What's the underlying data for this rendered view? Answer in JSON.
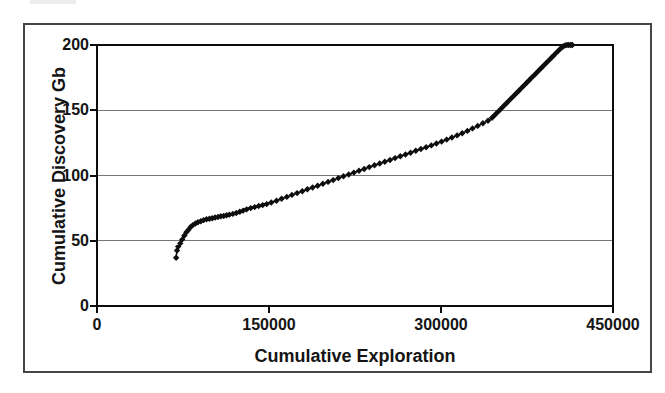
{
  "chart_data": {
    "type": "line",
    "marker": "diamond",
    "title": "",
    "xlabel": "Cumulative Exploration",
    "ylabel": "Cumulative Discovery Gb",
    "xlim": [
      0,
      450000
    ],
    "ylim": [
      0,
      200
    ],
    "x_ticks": [
      0,
      150000,
      300000,
      450000
    ],
    "y_ticks": [
      0,
      50,
      100,
      150,
      200
    ],
    "x_tick_labels": [
      "0",
      "150000",
      "300000",
      "450000"
    ],
    "y_tick_labels": [
      "200",
      "150",
      "100",
      "50",
      "0"
    ],
    "y_gridlines": [
      50,
      100,
      150
    ],
    "grid": "horizontal-only",
    "legend": "none",
    "colors": {
      "series": "#0d0d0d",
      "axis": "#0d0d0d",
      "grid": "#757575",
      "frame": "#454545"
    },
    "points": [
      [
        69000,
        37
      ],
      [
        69800,
        42.5
      ],
      [
        70800,
        45.5
      ],
      [
        72600,
        48
      ],
      [
        74400,
        51
      ],
      [
        76200,
        54
      ],
      [
        78000,
        56.5
      ],
      [
        79800,
        58.5
      ],
      [
        81600,
        60.5
      ],
      [
        83600,
        62
      ],
      [
        85800,
        63.2
      ],
      [
        88000,
        64.2
      ],
      [
        90500,
        65
      ],
      [
        93000,
        65.8
      ],
      [
        95500,
        66.4
      ],
      [
        98000,
        66.9
      ],
      [
        100500,
        67.3
      ],
      [
        103000,
        67.8
      ],
      [
        105500,
        68.2
      ],
      [
        108000,
        68.7
      ],
      [
        110500,
        69
      ],
      [
        113000,
        69.5
      ],
      [
        115500,
        70
      ],
      [
        118500,
        70.6
      ],
      [
        121500,
        71.3
      ],
      [
        124500,
        72.2
      ],
      [
        127500,
        73.1
      ],
      [
        130500,
        74
      ],
      [
        134000,
        75
      ],
      [
        137500,
        75.8
      ],
      [
        141000,
        76.6
      ],
      [
        144500,
        77.3
      ],
      [
        148000,
        78.1
      ],
      [
        152000,
        79.3
      ],
      [
        156500,
        80.7
      ],
      [
        161000,
        82.2
      ],
      [
        165500,
        83.6
      ],
      [
        170000,
        85.1
      ],
      [
        174500,
        86.5
      ],
      [
        179000,
        87.9
      ],
      [
        183500,
        89.4
      ],
      [
        188000,
        90.8
      ],
      [
        192500,
        92.2
      ],
      [
        197000,
        93.7
      ],
      [
        201500,
        95.1
      ],
      [
        206000,
        96.5
      ],
      [
        210500,
        98
      ],
      [
        215000,
        99.4
      ],
      [
        219500,
        100.8
      ],
      [
        224000,
        102.2
      ],
      [
        228500,
        103.6
      ],
      [
        233000,
        105
      ],
      [
        237500,
        106.4
      ],
      [
        242000,
        107.8
      ],
      [
        246500,
        109.2
      ],
      [
        251000,
        110.5
      ],
      [
        255500,
        111.9
      ],
      [
        260000,
        113.3
      ],
      [
        264500,
        114.7
      ],
      [
        269000,
        116.1
      ],
      [
        273500,
        117.5
      ],
      [
        278000,
        118.9
      ],
      [
        282500,
        120.3
      ],
      [
        287000,
        121.7
      ],
      [
        291500,
        123.1
      ],
      [
        296000,
        124.5
      ],
      [
        300500,
        126
      ],
      [
        305000,
        127.5
      ],
      [
        309500,
        129.1
      ],
      [
        314000,
        130.7
      ],
      [
        318500,
        132.4
      ],
      [
        323000,
        134.2
      ],
      [
        327500,
        136.1
      ],
      [
        332000,
        138
      ],
      [
        336500,
        140
      ],
      [
        341000,
        142
      ],
      [
        344500,
        144.2
      ],
      [
        346300,
        145.8
      ],
      [
        348100,
        147.4
      ],
      [
        349900,
        149
      ],
      [
        351700,
        150.6
      ],
      [
        353500,
        152.2
      ],
      [
        355300,
        153.8
      ],
      [
        357100,
        155.4
      ],
      [
        358900,
        157
      ],
      [
        360700,
        158.6
      ],
      [
        362500,
        160.2
      ],
      [
        364300,
        161.8
      ],
      [
        366100,
        163.4
      ],
      [
        367900,
        165
      ],
      [
        369700,
        166.6
      ],
      [
        371500,
        168.2
      ],
      [
        373300,
        169.8
      ],
      [
        375100,
        171.4
      ],
      [
        376900,
        173
      ],
      [
        378700,
        174.6
      ],
      [
        380500,
        176.2
      ],
      [
        382300,
        177.8
      ],
      [
        384100,
        179.4
      ],
      [
        385900,
        181
      ],
      [
        387700,
        182.6
      ],
      [
        389500,
        184.2
      ],
      [
        391300,
        185.8
      ],
      [
        393100,
        187.4
      ],
      [
        394900,
        189
      ],
      [
        396700,
        190.6
      ],
      [
        398500,
        192.2
      ],
      [
        400300,
        193.8
      ],
      [
        402100,
        195.4
      ],
      [
        403900,
        196.9
      ],
      [
        405500,
        198.2
      ],
      [
        406800,
        199.1
      ],
      [
        408200,
        199.7
      ],
      [
        409800,
        200
      ],
      [
        411400,
        200
      ],
      [
        413000,
        200
      ],
      [
        414500,
        200
      ]
    ]
  }
}
